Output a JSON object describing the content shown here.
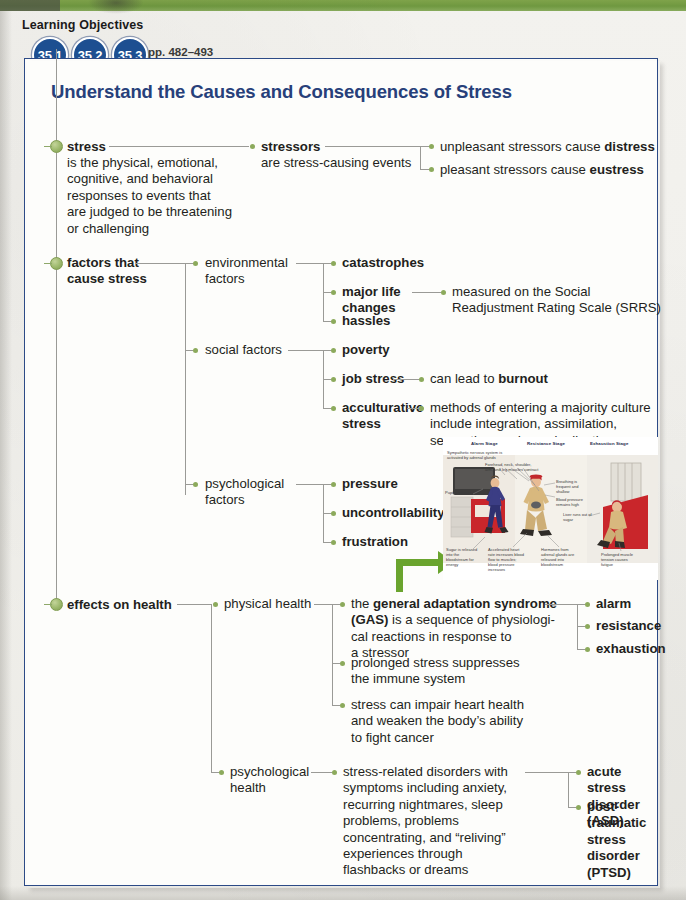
{
  "header": {
    "learning_objectives_label": "Learning Objectives",
    "badges": [
      "35.1",
      "35.2",
      "35.3"
    ],
    "pages": "pp. 482–493"
  },
  "map": {
    "title": "Understand the Causes and Consequences of Stress",
    "branches": {
      "stress": {
        "term": "stress",
        "definition": "is the physical, emotional, cognitive, and behavioral responses to events that are judged to be threatening or challenging",
        "def_lines": [
          "is the physical, emotional,",
          "cognitive, and behavioral",
          "responses to events that",
          "are judged to be threatening",
          "or challenging"
        ],
        "stressors_term": "stressors",
        "stressors_def": "are stress-causing events",
        "outcomes": [
          {
            "prefix": "unpleasant stressors cause ",
            "bold": "distress"
          },
          {
            "prefix": "pleasant stressors cause ",
            "bold": "eustress"
          }
        ]
      },
      "factors": {
        "label_line1": "factors that",
        "label_line2": "cause stress",
        "groups": [
          {
            "name": "environmental-factors",
            "label_lines": [
              "environmental",
              "factors"
            ],
            "items": [
              {
                "label_lines": [
                  "catastrophes"
                ],
                "bold": true
              },
              {
                "label_lines": [
                  "major life",
                  "changes"
                ],
                "bold": true,
                "detail_lines": [
                  "measured on the Social",
                  "Readjustment Rating Scale (SRRS)"
                ]
              },
              {
                "label_lines": [
                  "hassles"
                ],
                "bold": true
              }
            ]
          },
          {
            "name": "social-factors",
            "label_lines": [
              "social factors"
            ],
            "items": [
              {
                "label_lines": [
                  "poverty"
                ],
                "bold": true
              },
              {
                "label_lines": [
                  "job stress"
                ],
                "bold": true,
                "detail_prefix": "can lead to ",
                "detail_bold": "burnout"
              },
              {
                "label_lines": [
                  "acculturative",
                  "stress"
                ],
                "bold": true,
                "detail_lines": [
                  "methods of entering a majority culture",
                  "include integration, assimilation,",
                  "separation, and marginalization"
                ]
              }
            ]
          },
          {
            "name": "psychological-factors",
            "label_lines": [
              "psychological",
              "factors"
            ],
            "items": [
              {
                "label_lines": [
                  "pressure"
                ],
                "bold": true
              },
              {
                "label_lines": [
                  "uncontrollability"
                ],
                "bold": true
              },
              {
                "label_lines": [
                  "frustration"
                ],
                "bold": true
              }
            ]
          }
        ]
      },
      "effects": {
        "label": "effects on health",
        "groups": [
          {
            "name": "physical-health",
            "label_lines": [
              "physical health"
            ],
            "items": [
              {
                "rich_lines": [
                  [
                    {
                      "t": "the ",
                      "b": false
                    },
                    {
                      "t": "general adaptation syndrome",
                      "b": true
                    }
                  ],
                  [
                    {
                      "t": "(GAS)",
                      "b": true
                    },
                    {
                      "t": " is a sequence of physiologi-",
                      "b": false
                    }
                  ],
                  [
                    {
                      "t": "cal reactions in response to",
                      "b": false
                    }
                  ],
                  [
                    {
                      "t": "a stressor",
                      "b": false
                    }
                  ]
                ],
                "sub_items": [
                  "alarm",
                  "resistance",
                  "exhaustion"
                ]
              },
              {
                "rich_lines": [
                  [
                    {
                      "t": "prolonged stress suppresses",
                      "b": false
                    }
                  ],
                  [
                    {
                      "t": "the immune system",
                      "b": false
                    }
                  ]
                ]
              },
              {
                "rich_lines": [
                  [
                    {
                      "t": "stress can impair heart health",
                      "b": false
                    }
                  ],
                  [
                    {
                      "t": "and weaken the body’s ability",
                      "b": false
                    }
                  ],
                  [
                    {
                      "t": "to fight cancer",
                      "b": false
                    }
                  ]
                ]
              }
            ]
          },
          {
            "name": "psychological-health",
            "label_lines": [
              "psychological",
              "health"
            ],
            "items": [
              {
                "rich_lines": [
                  [
                    {
                      "t": "stress-related disorders with",
                      "b": false
                    }
                  ],
                  [
                    {
                      "t": "symptoms including anxiety,",
                      "b": false
                    }
                  ],
                  [
                    {
                      "t": "recurring nightmares, sleep",
                      "b": false
                    }
                  ],
                  [
                    {
                      "t": "problems, problems",
                      "b": false
                    }
                  ],
                  [
                    {
                      "t": "concentrating, and “reliving”",
                      "b": false
                    }
                  ],
                  [
                    {
                      "t": "experiences through",
                      "b": false
                    }
                  ],
                  [
                    {
                      "t": "flashbacks or dreams",
                      "b": false
                    }
                  ]
                ],
                "sub_items_multiline": [
                  [
                    "acute stress",
                    "disorder (ASD)"
                  ],
                  [
                    "post-traumatic",
                    "stress disorder",
                    "(PTSD)"
                  ]
                ]
              }
            ]
          }
        ]
      }
    }
  },
  "figure": {
    "stages": [
      "Alarm Stage",
      "Resistance Stage",
      "Exhaustion Stage"
    ],
    "captions": {
      "sympathetic": "Sympathetic nervous system is activated by adrenal glands",
      "muscles": "Forehead, neck, shoulder, arm, and leg muscles contract",
      "pupils": "Pupils enlarge",
      "breathing": "Breathing is frequent and shallow",
      "blood_pressure": "Blood pressure remains high",
      "liver": "Liver runs out of sugar",
      "sugar": "Sugar is released into the bloodstream for energy",
      "heart_rate": "Accelerated heart rate increases blood flow to muscles; blood pressure increases",
      "hormones": "Hormones from adrenal glands are released into bloodstream",
      "muscle_tension": "Prolonged muscle tension causes fatigue"
    }
  },
  "colors": {
    "title_blue": "#27407a",
    "badge_blue": "#1d4f91",
    "box_border_blue": "#2c4a86",
    "node_green": "#8caa5c",
    "band_green": "#6f9840",
    "arrow_green": "#6aa42e"
  }
}
